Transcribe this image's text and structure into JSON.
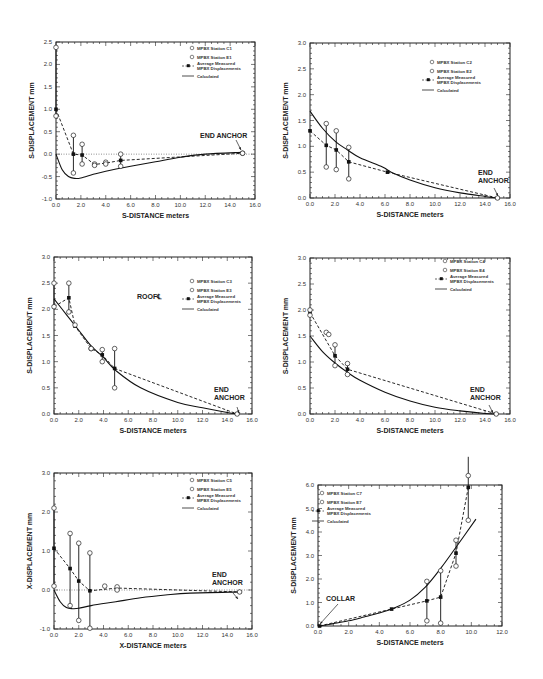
{
  "chart_data": [
    {
      "id": "c1",
      "type": "line",
      "title": "",
      "xlabel": "S-DISTANCE meters",
      "ylabel": "S-DISPLACEMENT mm",
      "xlim": [
        0,
        16
      ],
      "ylim": [
        -1.0,
        2.5
      ],
      "xticks": [
        "0.0",
        "2.0",
        "4.0",
        "6.0",
        "8.0",
        "10.0",
        "12.0",
        "14.0",
        "16.0"
      ],
      "yticks": [
        "-1.0",
        "-0.5",
        "0.0",
        "0.5",
        "1.0",
        "1.5",
        "2.0",
        "2.5"
      ],
      "legend": [
        "MPBX Station C1",
        "MPBX Station E1",
        "Average Measured MPBX Displacements",
        "Calculated"
      ],
      "annotations": [
        "END ANCHOR"
      ],
      "series": [
        {
          "name": "MPBX Station C1",
          "x": [
            0.0,
            1.4,
            2.1,
            3.1,
            4.0,
            5.2,
            15.0
          ],
          "y": [
            2.38,
            0.42,
            0.22,
            -0.22,
            -0.18,
            0.0,
            0.02
          ]
        },
        {
          "name": "MPBX Station E1",
          "x": [
            0.0,
            1.4,
            2.1,
            3.1,
            4.0,
            5.2,
            15.0
          ],
          "y": [
            0.85,
            -0.42,
            -0.22,
            -0.25,
            -0.22,
            -0.27,
            0.02
          ]
        },
        {
          "name": "Average Measured MPBX Displacements",
          "x": [
            0.0,
            1.4,
            2.1,
            3.1,
            4.0,
            5.2,
            15.0
          ],
          "y": [
            1.0,
            0.0,
            -0.02,
            -0.23,
            -0.2,
            -0.14,
            0.02
          ]
        },
        {
          "name": "Calculated",
          "x": [
            0.0,
            0.5,
            1.0,
            1.5,
            2.0,
            3.0,
            4.0,
            6.0,
            8.0,
            10.0,
            12.0,
            15.0
          ],
          "y": [
            0.0,
            -0.35,
            -0.5,
            -0.54,
            -0.53,
            -0.45,
            -0.38,
            -0.27,
            -0.17,
            -0.07,
            0.0,
            0.04
          ]
        }
      ]
    },
    {
      "id": "c2",
      "type": "line",
      "title": "",
      "xlabel": "S-DISTANCE meters",
      "ylabel": "S-DISPLACEMENT mm",
      "xlim": [
        0,
        16
      ],
      "ylim": [
        0.0,
        3.0
      ],
      "xticks": [
        "0.0",
        "2.0",
        "4.0",
        "6.0",
        "8.0",
        "10.0",
        "12.0",
        "14.0",
        "16.0"
      ],
      "yticks": [
        "0.0",
        "0.5",
        "1.0",
        "1.5",
        "2.0",
        "2.5",
        "3.0"
      ],
      "legend": [
        "MPBX Station C2",
        "MPBX Station E2",
        "Average Measured MPBX Displacements",
        "Calculated"
      ],
      "annotations": [
        "END ANCHOR"
      ],
      "series": [
        {
          "name": "MPBX Station C2",
          "x": [
            1.3,
            2.1,
            3.1
          ],
          "y": [
            1.44,
            1.3,
            0.98
          ]
        },
        {
          "name": "MPBX Station E2",
          "x": [
            1.3,
            2.1,
            3.1,
            15.0
          ],
          "y": [
            0.6,
            0.55,
            0.37,
            0.0
          ]
        },
        {
          "name": "Average Measured MPBX Displacements",
          "x": [
            0.0,
            1.3,
            2.1,
            3.1,
            6.2,
            15.0
          ],
          "y": [
            1.3,
            1.02,
            0.93,
            0.7,
            0.5,
            0.0
          ]
        },
        {
          "name": "Calculated",
          "x": [
            0.0,
            1.0,
            2.0,
            3.0,
            4.0,
            5.8,
            6.5,
            8.0,
            10.0,
            12.0,
            14.0,
            15.0
          ],
          "y": [
            1.68,
            1.35,
            1.1,
            0.93,
            0.78,
            0.6,
            0.5,
            0.35,
            0.2,
            0.1,
            0.03,
            0.0
          ]
        }
      ]
    },
    {
      "id": "c3",
      "type": "line",
      "title": "",
      "xlabel": "S-DISTANCE meters",
      "ylabel": "S-DISPLACEMENT mm",
      "xlim": [
        0,
        16
      ],
      "ylim": [
        0.0,
        3.0
      ],
      "xticks": [
        "0.0",
        "2.0",
        "4.0",
        "6.0",
        "8.0",
        "10.0",
        "12.0",
        "14.0",
        "16.0"
      ],
      "yticks": [
        "0.0",
        "0.5",
        "1.0",
        "1.5",
        "2.0",
        "2.5",
        "3.0"
      ],
      "legend": [
        "MPBX Station C3",
        "MPBX Station E3",
        "Average Measured MPBX Displacements",
        "Calculated"
      ],
      "annotations": [
        "ROOF℄",
        "END ANCHOR"
      ],
      "series": [
        {
          "name": "MPBX Station C3",
          "x": [
            0.0,
            1.2,
            1.7,
            3.0,
            3.9,
            4.9
          ],
          "y": [
            2.5,
            2.5,
            1.7,
            1.25,
            1.23,
            1.25
          ]
        },
        {
          "name": "MPBX Station E3",
          "x": [
            0.0,
            1.2,
            3.0,
            3.9,
            4.9,
            14.8
          ],
          "y": [
            2.05,
            1.95,
            1.25,
            1.0,
            0.5,
            0.0
          ]
        },
        {
          "name": "Average Measured MPBX Displacements",
          "x": [
            0.0,
            1.2,
            1.7,
            3.0,
            3.9,
            4.9,
            14.8
          ],
          "y": [
            2.05,
            2.22,
            1.68,
            1.25,
            1.13,
            0.87,
            0.0
          ]
        },
        {
          "name": "Calculated",
          "x": [
            0.0,
            1.0,
            2.0,
            3.0,
            4.0,
            5.0,
            7.0,
            10.0,
            12.0,
            14.0,
            14.8
          ],
          "y": [
            2.2,
            1.9,
            1.6,
            1.3,
            1.08,
            0.83,
            0.5,
            0.22,
            0.12,
            0.03,
            0.0
          ]
        }
      ]
    },
    {
      "id": "c4",
      "type": "line",
      "title": "",
      "xlabel": "S-DISTANCE meters",
      "ylabel": "S-DISPLACEMENT mm",
      "xlim": [
        0,
        16
      ],
      "ylim": [
        0.0,
        3.0
      ],
      "xticks": [
        "0.0",
        "2.0",
        "4.0",
        "6.0",
        "8.0",
        "10.0",
        "12.0",
        "14.0",
        "16.0"
      ],
      "yticks": [
        "0.0",
        "0.5",
        "1.0",
        "1.5",
        "2.0",
        "2.5",
        "3.0"
      ],
      "legend": [
        "MPBX Station C4",
        "MPBX Station E4",
        "Average Measured MPBX Displacements",
        "Calculated"
      ],
      "annotations": [
        "END ANCHOR"
      ],
      "series": [
        {
          "name": "MPBX Station C4",
          "x": [
            0.0,
            1.3,
            2.0,
            3.0
          ],
          "y": [
            2.0,
            1.57,
            1.33,
            0.97
          ]
        },
        {
          "name": "MPBX Station E4",
          "x": [
            0.0,
            1.5,
            2.0,
            3.0,
            14.9
          ],
          "y": [
            1.9,
            1.53,
            0.93,
            0.76,
            0.0
          ]
        },
        {
          "name": "Average Measured MPBX Displacements",
          "x": [
            0.0,
            2.0,
            3.0,
            14.9
          ],
          "y": [
            1.95,
            1.12,
            0.86,
            0.0
          ]
        },
        {
          "name": "Calculated",
          "x": [
            0.0,
            1.0,
            2.0,
            3.0,
            4.0,
            6.0,
            8.0,
            10.0,
            12.0,
            14.0,
            14.9
          ],
          "y": [
            1.5,
            1.2,
            0.98,
            0.8,
            0.65,
            0.42,
            0.25,
            0.13,
            0.06,
            0.01,
            0.0
          ]
        }
      ]
    },
    {
      "id": "c5",
      "type": "line",
      "title": "",
      "xlabel": "X-DISTANCE meters",
      "ylabel": "X-DISPLACEMENT mm",
      "xlim": [
        0,
        16
      ],
      "ylim": [
        -1.0,
        3.0
      ],
      "xticks": [
        "0.0",
        "2.0",
        "4.0",
        "6.0",
        "8.0",
        "10.0",
        "12.0",
        "14.0",
        "16.0"
      ],
      "yticks": [
        "-1.0",
        "0.0",
        "1.0",
        "2.0",
        "3.0"
      ],
      "legend": [
        "MPBX Station C5",
        "MPBX Station E5",
        "Average Measured MPBX Displacements",
        "Calculated"
      ],
      "annotations": [
        "END ANCHOR"
      ],
      "series": [
        {
          "name": "MPBX Station C5",
          "x": [
            0.0,
            1.3,
            2.0,
            2.9,
            4.1,
            5.1
          ],
          "y": [
            2.1,
            1.45,
            1.2,
            0.95,
            0.1,
            0.08
          ]
        },
        {
          "name": "MPBX Station E5",
          "x": [
            0.0,
            1.3,
            2.0,
            2.9,
            5.1,
            15.0
          ],
          "y": [
            0.1,
            -0.4,
            -0.78,
            -0.98,
            0.0,
            -0.05
          ]
        },
        {
          "name": "Average Measured MPBX Displacements",
          "x": [
            0.0,
            1.3,
            2.0,
            2.9,
            5.1,
            15.0
          ],
          "y": [
            1.07,
            0.55,
            0.23,
            -0.02,
            0.05,
            -0.05
          ]
        },
        {
          "name": "Calculated",
          "x": [
            0.0,
            0.5,
            1.0,
            1.5,
            2.0,
            3.0,
            5.0,
            7.0,
            9.0,
            11.0,
            15.0
          ],
          "y": [
            0.0,
            -0.3,
            -0.45,
            -0.48,
            -0.47,
            -0.4,
            -0.3,
            -0.2,
            -0.13,
            -0.08,
            -0.05
          ]
        }
      ]
    },
    {
      "id": "c6",
      "type": "line",
      "title": "",
      "xlabel": "S-DISTANCE meters",
      "ylabel": "S-DISPLACEMENT mm",
      "xlim": [
        0,
        12
      ],
      "ylim": [
        0.0,
        6.0
      ],
      "xticks": [
        "0.0",
        "2.0",
        "4.0",
        "6.0",
        "8.0",
        "10.0",
        "12.0"
      ],
      "yticks": [
        "0.0",
        "1.0",
        "2.0",
        "3.0",
        "4.0",
        "5.0",
        "6.0"
      ],
      "legend": [
        "MPBX Station C7",
        "MPBX Station E7",
        "Average Measured MPBX Displacements",
        "Calculated"
      ],
      "annotations": [
        "COLLAR"
      ],
      "series": [
        {
          "name": "MPBX Station C7",
          "x": [
            7.1,
            8.0,
            9.0,
            9.8
          ],
          "y": [
            1.9,
            2.35,
            3.65,
            7.2
          ]
        },
        {
          "name": "MPBX Station E7",
          "x": [
            7.1,
            8.0,
            9.0,
            9.8
          ],
          "y": [
            0.22,
            0.12,
            2.55,
            4.5
          ]
        },
        {
          "name": "Average Measured MPBX Displacements",
          "x": [
            0.1,
            4.8,
            7.1,
            8.0,
            9.0,
            9.8
          ],
          "y": [
            0.0,
            0.72,
            1.07,
            1.23,
            3.1,
            5.9
          ]
        },
        {
          "name": "Calculated",
          "x": [
            0.1,
            1.0,
            2.0,
            3.0,
            4.0,
            5.0,
            6.0,
            7.0,
            8.0,
            9.0,
            10.3
          ],
          "y": [
            0.0,
            0.1,
            0.22,
            0.38,
            0.55,
            0.78,
            1.1,
            1.65,
            2.45,
            3.35,
            4.55
          ]
        }
      ]
    }
  ]
}
